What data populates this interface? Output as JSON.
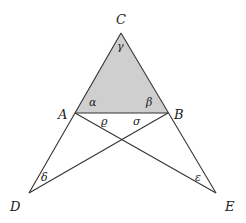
{
  "diagram": {
    "title": "",
    "colors": {
      "stroke": "#333333",
      "fill": "#cfcfcf",
      "background": "#ffffff"
    },
    "points": {
      "C": {
        "x": 121,
        "y": 33
      },
      "A": {
        "x": 75,
        "y": 113
      },
      "B": {
        "x": 168,
        "y": 113
      },
      "D": {
        "x": 29,
        "y": 193
      },
      "E": {
        "x": 216,
        "y": 193
      },
      "X": {
        "x": 122,
        "y": 140
      }
    },
    "shaded_triangle": [
      "A",
      "B",
      "C"
    ],
    "segments": [
      [
        "C",
        "D"
      ],
      [
        "C",
        "E"
      ],
      [
        "A",
        "B"
      ],
      [
        "A",
        "E"
      ],
      [
        "B",
        "D"
      ]
    ],
    "vertex_labels": {
      "C": "C",
      "A": "A",
      "B": "B",
      "D": "D",
      "E": "E"
    },
    "angle_labels": {
      "gamma": "γ",
      "alpha": "α",
      "beta": "β",
      "rho": "ϱ",
      "sigma": "σ",
      "delta": "δ",
      "epsilon": "ε"
    }
  }
}
